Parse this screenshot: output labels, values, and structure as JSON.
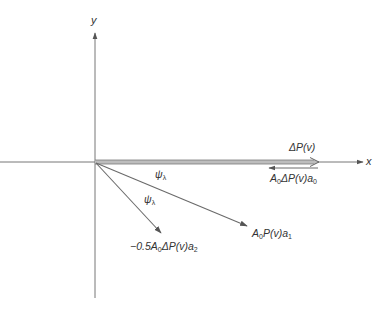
{
  "diagram": {
    "type": "vector-diagram",
    "axes": {
      "x_label": "x",
      "y_label": "y",
      "origin": [
        95,
        162
      ]
    },
    "vectors": [
      {
        "id": "delta-p",
        "label_main": "ΔP(v)",
        "from": [
          95,
          162
        ],
        "to": [
          318,
          162
        ],
        "style": "double-thick"
      },
      {
        "id": "a0-delta-p-a0",
        "label_prefix": "A",
        "label_sub1": "0",
        "label_mid": "ΔP(v)a",
        "label_sub2": "0",
        "from": [
          318,
          167
        ],
        "to": [
          268,
          167
        ],
        "style": "single"
      },
      {
        "id": "a0-p-a1",
        "label_prefix": "A",
        "label_sub1": "0",
        "label_mid": "P(v)a",
        "label_sub2": "1",
        "from": [
          95,
          162
        ],
        "to": [
          247,
          226
        ],
        "style": "single"
      },
      {
        "id": "neg-half-a0-delta-p-a2",
        "label_prefix": "−0.5A",
        "label_sub1": "0",
        "label_mid": "ΔP(v)a",
        "label_sub2": "2",
        "from": [
          95,
          162
        ],
        "to": [
          162,
          233
        ],
        "style": "single"
      }
    ],
    "angle_labels": [
      {
        "symbol": "ψ",
        "sub": "λ"
      },
      {
        "symbol": "ψ",
        "sub": "λ"
      }
    ],
    "colors": {
      "axis": "#555555",
      "vector": "#6a6a6a",
      "double_fill": "#bdbdbd",
      "text": "#333333"
    }
  }
}
